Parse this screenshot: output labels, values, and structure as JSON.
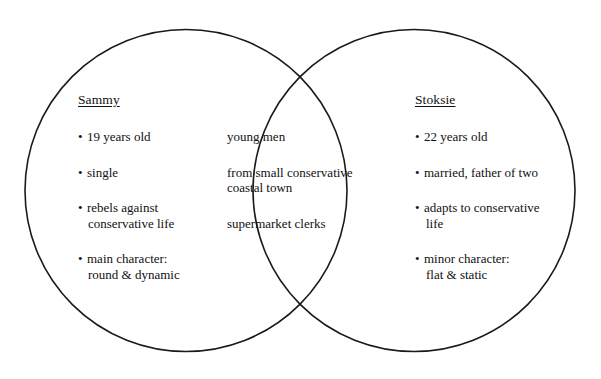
{
  "diagram": {
    "type": "venn",
    "background_color": "#ffffff",
    "stroke_color": "#1a1a1a",
    "text_color": "#111111",
    "left": {
      "title": "Sammy",
      "items": [
        {
          "line1": "19 years old",
          "line2": ""
        },
        {
          "line1": "single",
          "line2": ""
        },
        {
          "line1": "rebels against",
          "line2": "conservative life"
        },
        {
          "line1": "main character:",
          "line2": "round & dynamic"
        }
      ]
    },
    "center": {
      "title": "",
      "items": [
        {
          "line1": "young men",
          "line2": ""
        },
        {
          "line1": "from small conservative",
          "line2": "coastal town"
        },
        {
          "line1": "supermarket clerks",
          "line2": ""
        }
      ]
    },
    "right": {
      "title": "Stoksie",
      "items": [
        {
          "line1": "22 years old",
          "line2": ""
        },
        {
          "line1": "married, father of two",
          "line2": ""
        },
        {
          "line1": "adapts to conservative",
          "line2": "life"
        },
        {
          "line1": "minor character:",
          "line2": "flat & static"
        }
      ]
    },
    "bullet_glyph": "•"
  }
}
